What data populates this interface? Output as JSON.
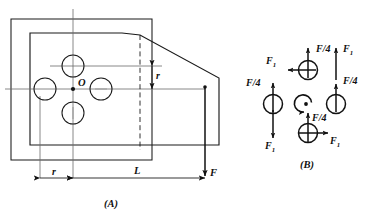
{
  "figure": {
    "title_a": "(A)",
    "title_b": "(B)",
    "center_label": "O"
  },
  "diagram_a": {
    "name": "bracket-plate-loading-diagram",
    "dimensions": [
      {
        "id": "r_vertical",
        "label": "r",
        "orientation": "vertical"
      },
      {
        "id": "r_horizontal",
        "label": "r",
        "orientation": "horizontal"
      },
      {
        "id": "L_horizontal",
        "label": "L",
        "orientation": "horizontal"
      }
    ],
    "force": {
      "label": "F",
      "direction": "down"
    },
    "bolt_count": 4
  },
  "diagram_b": {
    "name": "bolt-group-free-body-diagram",
    "moment_symbol": "counterclockwise-moment",
    "bolts": [
      {
        "id": "top-bolt",
        "forces": [
          {
            "label": "F/4",
            "direction": "up"
          },
          {
            "label": "F1",
            "text": "F",
            "sub": "1",
            "direction": "left"
          }
        ]
      },
      {
        "id": "left-bolt",
        "forces": [
          {
            "label": "F/4",
            "direction": "up"
          },
          {
            "label": "F1",
            "text": "F",
            "sub": "1",
            "direction": "down"
          }
        ]
      },
      {
        "id": "right-bolt",
        "forces": [
          {
            "label": "F/4",
            "direction": "up"
          },
          {
            "label": "F1",
            "text": "F",
            "sub": "1",
            "direction": "up"
          }
        ]
      },
      {
        "id": "bottom-bolt",
        "forces": [
          {
            "label": "F/4",
            "direction": "up"
          },
          {
            "label": "F1",
            "text": "F",
            "sub": "1",
            "direction": "right"
          }
        ]
      }
    ],
    "labels": {
      "top_f4": "F/4",
      "top_f1_text": "F",
      "top_f1_sub": "1",
      "topright_f1_text": "F",
      "topright_f1_sub": "1",
      "left_f4": "F/4",
      "left_f1_text": "F",
      "left_f1_sub": "1",
      "right_f4_upper": "F/4",
      "right_f4_lower": "F/4",
      "bottom_f4": "F/4",
      "bottom_f1_text": "F",
      "bottom_f1_sub": "1"
    }
  },
  "colors": {
    "stroke": "#1a1a1a",
    "thin": "#555555",
    "background": "#ffffff"
  }
}
